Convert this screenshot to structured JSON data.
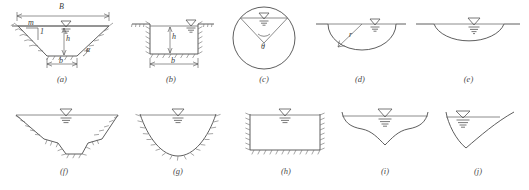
{
  "figure": {
    "line_color": "#4c4c4c",
    "water_line_color": "#6e6e6e",
    "background": "#ffffff",
    "water_surface_symbol": "inverted-triangle-with-hatch"
  },
  "panels": [
    {
      "id": "a",
      "caption": "(a)",
      "name": "trapezoidal-channel-dimensioned",
      "labels": [
        {
          "key": "top_width",
          "text": "B"
        },
        {
          "key": "bottom_width",
          "text": "b"
        },
        {
          "key": "depth",
          "text": "h"
        },
        {
          "key": "slope_horizontal",
          "text": "m"
        },
        {
          "key": "slope_vertical",
          "text": "1"
        },
        {
          "key": "side_angle",
          "text": "α"
        }
      ]
    },
    {
      "id": "b",
      "caption": "(b)",
      "name": "rectangular-channel-dimensioned",
      "labels": [
        {
          "key": "bottom_width",
          "text": "b"
        },
        {
          "key": "depth",
          "text": "h"
        }
      ]
    },
    {
      "id": "c",
      "caption": "(c)",
      "name": "circular-conduit-partially-full",
      "labels": [
        {
          "key": "central_angle",
          "text": "θ"
        }
      ]
    },
    {
      "id": "d",
      "caption": "(d)",
      "name": "semicircular-channel-with-radius",
      "labels": [
        {
          "key": "radius",
          "text": "r"
        }
      ]
    },
    {
      "id": "e",
      "caption": "(e)",
      "name": "shallow-circular-segment-channel",
      "labels": []
    },
    {
      "id": "f",
      "caption": "(f)",
      "name": "stepped-trapezoidal-earth-channel",
      "labels": []
    },
    {
      "id": "g",
      "caption": "(g)",
      "name": "parabolic-earth-channel",
      "labels": []
    },
    {
      "id": "h",
      "caption": "(h)",
      "name": "lined-rectangular-channel",
      "labels": []
    },
    {
      "id": "i",
      "caption": "(i)",
      "name": "natural-irregular-wide-channel",
      "labels": []
    },
    {
      "id": "j",
      "caption": "(j)",
      "name": "natural-asymmetric-channel",
      "labels": []
    }
  ]
}
